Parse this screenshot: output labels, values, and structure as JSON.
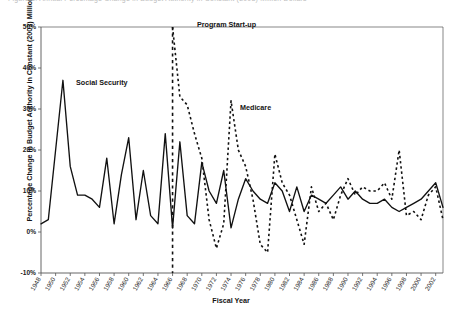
{
  "figure": {
    "top_cut_text": "Figure 5. Annual Percentage Change in Budget Authority in Constant (2003) Million Dollars",
    "xlabel": "Fiscal Year",
    "ylabel": "Percentage Change in Budget Authority in Constant (2003) Million $"
  },
  "annotations": {
    "social_security": "Social Security",
    "program_startup": "Program Start-up",
    "medicare": "Medicare"
  },
  "colors": {
    "line": "#111111",
    "axis": "#555555",
    "text": "#141414"
  },
  "chart_data": {
    "type": "line",
    "title": "",
    "xlabel": "Fiscal Year",
    "ylabel": "Percentage Change in Budget Authority in Constant (2003) Million $",
    "xlim": [
      1948,
      2003
    ],
    "ylim": [
      -10,
      50
    ],
    "ytick_labels": [
      "50%",
      "40%",
      "30%",
      "20%",
      "10%",
      "0%",
      "-10%"
    ],
    "ytick_values": [
      50,
      40,
      30,
      20,
      10,
      0,
      -10
    ],
    "xtick_labels": [
      "1948",
      "1950",
      "1952",
      "1954",
      "1956",
      "1958",
      "1960",
      "1962",
      "1964",
      "1966",
      "1968",
      "1970",
      "1972",
      "1974",
      "1976",
      "1978",
      "1980",
      "1982",
      "1984",
      "1986",
      "1988",
      "1990",
      "1992",
      "1994",
      "1996",
      "1998",
      "2000",
      "2002"
    ],
    "xtick_values": [
      1948,
      1950,
      1952,
      1954,
      1956,
      1958,
      1960,
      1962,
      1964,
      1966,
      1968,
      1970,
      1972,
      1974,
      1976,
      1978,
      1980,
      1982,
      1984,
      1986,
      1988,
      1990,
      1992,
      1994,
      1996,
      1998,
      2000,
      2002
    ],
    "grid": false,
    "legend_position": "inline-annotations",
    "vline": {
      "x": 1966,
      "label": "Program Start-up",
      "style": "dashed"
    },
    "series": [
      {
        "name": "Social Security",
        "style": "solid",
        "x": [
          1948,
          1949,
          1950,
          1951,
          1952,
          1953,
          1954,
          1955,
          1956,
          1957,
          1958,
          1959,
          1960,
          1961,
          1962,
          1963,
          1964,
          1965,
          1966,
          1967,
          1968,
          1969,
          1970,
          1971,
          1972,
          1973,
          1974,
          1975,
          1976,
          1977,
          1978,
          1979,
          1980,
          1981,
          1982,
          1983,
          1984,
          1985,
          1986,
          1987,
          1988,
          1989,
          1990,
          1991,
          1992,
          1993,
          1994,
          1995,
          1996,
          1997,
          1998,
          1999,
          2000,
          2001,
          2002,
          2003
        ],
        "values": [
          2,
          3,
          20,
          37,
          16,
          9,
          9,
          8,
          6,
          18,
          2,
          14,
          23,
          3,
          15,
          4,
          2,
          24,
          1,
          22,
          4,
          2,
          17,
          10,
          7,
          15,
          1,
          8,
          13,
          10,
          8,
          7,
          12,
          10,
          5,
          11,
          5,
          9,
          8,
          7,
          9,
          11,
          8,
          10,
          8,
          7,
          7,
          8,
          6,
          5,
          6,
          7,
          8,
          10,
          12,
          6
        ]
      },
      {
        "name": "Medicare",
        "style": "dashed",
        "x": [
          1966,
          1967,
          1968,
          1969,
          1970,
          1971,
          1972,
          1973,
          1974,
          1975,
          1976,
          1977,
          1978,
          1979,
          1980,
          1981,
          1982,
          1983,
          1984,
          1985,
          1986,
          1987,
          1988,
          1989,
          1990,
          1991,
          1992,
          1993,
          1994,
          1995,
          1996,
          1997,
          1998,
          1999,
          2000,
          2001,
          2002,
          2003
        ],
        "values": [
          50,
          33,
          31,
          24,
          18,
          3,
          -4,
          2,
          32,
          20,
          16,
          8,
          -3,
          -5,
          19,
          12,
          9,
          3,
          -3,
          11,
          5,
          7,
          3,
          9,
          13,
          9,
          11,
          10,
          10,
          12,
          8,
          20,
          4,
          5,
          3,
          9,
          11,
          3
        ]
      }
    ]
  }
}
